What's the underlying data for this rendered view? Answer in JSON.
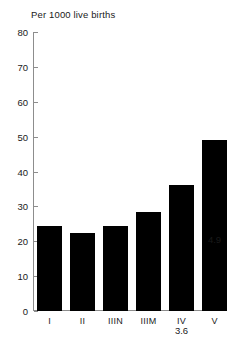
{
  "chart_data": {
    "type": "bar",
    "title": "Per 1000 live births",
    "xlabel": "",
    "ylabel": "",
    "ylim": [
      0,
      80
    ],
    "yticks": [
      0,
      10,
      20,
      30,
      40,
      50,
      60,
      70,
      80
    ],
    "grid": false,
    "legend": null,
    "categories": [
      "I",
      "II",
      "IIIN",
      "IIIM",
      "IV",
      "V"
    ],
    "values": [
      24.5,
      22.5,
      24.5,
      28.5,
      36,
      49
    ],
    "data_labels": [
      "2.5",
      "2.3",
      "2.5",
      "2.9",
      "3.6",
      "4.9"
    ],
    "bar_color": "#000000",
    "axis_color": "#8d8d8d",
    "background": "#ffffff",
    "text_color": "#1a1a1a"
  },
  "axis": {
    "ticks": [
      {
        "label": "80",
        "value": 80
      },
      {
        "label": "70",
        "value": 70
      },
      {
        "label": "60",
        "value": 60
      },
      {
        "label": "50",
        "value": 50
      },
      {
        "label": "40",
        "value": 40
      },
      {
        "label": "30",
        "value": 30
      },
      {
        "label": "20",
        "value": 20
      },
      {
        "label": "10",
        "value": 10
      },
      {
        "label": "0",
        "value": 0
      }
    ]
  }
}
